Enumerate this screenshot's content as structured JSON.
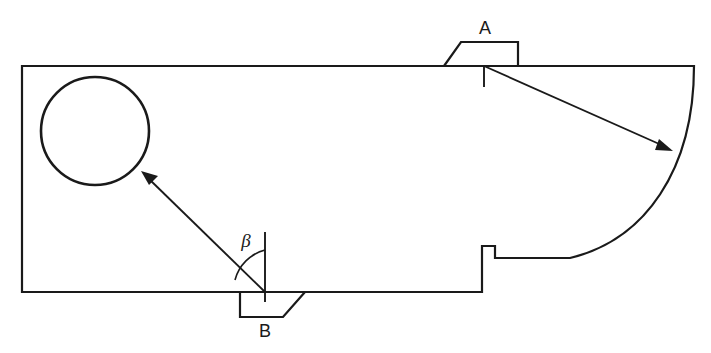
{
  "diagram": {
    "title": "Sectional machine element outline with angular reference",
    "background_color": "#ffffff",
    "stroke_color": "#1a1a1a",
    "canvas": {
      "width": 711,
      "height": 353
    },
    "labels": {
      "point_a": "A",
      "point_b": "B",
      "angle_beta": "β"
    },
    "label_positions": {
      "point_a": {
        "x": 485,
        "y": 34
      },
      "point_b": {
        "x": 265,
        "y": 335
      },
      "angle_beta": {
        "x": 246,
        "y": 246
      }
    },
    "body_outline": {
      "description": "Closed profile: rectangle with large concave arc on the right side and a stepped notch",
      "top_left": {
        "x": 22,
        "y": 66
      },
      "top_right": {
        "x": 694,
        "y": 66
      },
      "bottom_left": {
        "x": 22,
        "y": 292
      },
      "bottom_right_step": {
        "x": 482,
        "y": 292
      },
      "path": "M 22 66 L 694 66 C 694 170 645 240 570 258 L 495 258 L 495 246 L 482 246 L 482 292 L 22 292 Z"
    },
    "circle_feature": {
      "name": "bore-circle",
      "center": {
        "x": 95,
        "y": 131
      },
      "radius": 54
    },
    "feature_a": {
      "name": "boss-a",
      "side": "top",
      "description": "Trapezoidal boss projecting above the top edge",
      "path": "M 444 66 L 461 42 L 518 42 L 518 66"
    },
    "feature_b": {
      "name": "boss-b",
      "side": "bottom",
      "description": "Trapezoidal boss projecting below the bottom edge",
      "path": "M 240 292 L 240 317 L 283 317 L 305 292"
    },
    "leader_a": {
      "name": "leader-line-a",
      "from": {
        "x": 484,
        "y": 66
      },
      "to": {
        "x": 672,
        "y": 150
      },
      "tick": {
        "x": 484,
        "y": 66,
        "length": 21
      },
      "arrow_at": "arc"
    },
    "leader_b": {
      "name": "leader-line-b",
      "from": {
        "x": 265,
        "y": 292
      },
      "to": {
        "x": 143,
        "y": 173
      },
      "arrow_at": "circle"
    },
    "angle_reference": {
      "name": "vertical-datum-b",
      "apex": {
        "x": 265,
        "y": 292
      },
      "vertical_top": {
        "x": 265,
        "y": 232
      },
      "arc_radius": 42,
      "arc_path": "M 265 250 A 42 42 0 0 0 235 280"
    }
  }
}
